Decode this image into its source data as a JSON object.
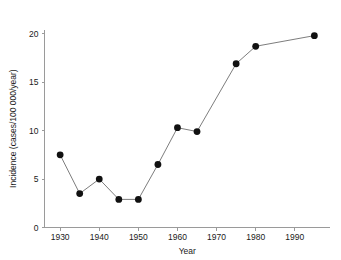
{
  "chart_data": {
    "type": "line",
    "title": "",
    "xlabel": "Year",
    "ylabel": "Incidence (cases/100 000/year)",
    "x": [
      1930,
      1935,
      1940,
      1945,
      1950,
      1955,
      1960,
      1965,
      1975,
      1980,
      1995
    ],
    "values": [
      7.5,
      3.5,
      5.0,
      2.9,
      2.9,
      6.5,
      10.3,
      9.9,
      16.9,
      18.7,
      19.8
    ],
    "series": [
      {
        "name": "Incidence",
        "points": [
          {
            "x": 1930,
            "y": 7.5
          },
          {
            "x": 1935,
            "y": 3.5
          },
          {
            "x": 1940,
            "y": 5.0
          },
          {
            "x": 1945,
            "y": 2.9
          },
          {
            "x": 1950,
            "y": 2.9
          },
          {
            "x": 1955,
            "y": 6.5
          },
          {
            "x": 1960,
            "y": 10.3
          },
          {
            "x": 1965,
            "y": 9.9
          },
          {
            "x": 1975,
            "y": 16.9
          },
          {
            "x": 1980,
            "y": 18.7
          },
          {
            "x": 1995,
            "y": 19.8
          }
        ],
        "line_color": "#6e6e6e",
        "marker_color": "#111111",
        "marker": "filled-circle"
      }
    ],
    "xlim": [
      1926,
      1999
    ],
    "ylim": [
      0,
      21
    ],
    "xticks": [
      1930,
      1940,
      1950,
      1960,
      1970,
      1980,
      1990
    ],
    "xtick_labels": [
      "1930",
      "1940",
      "1950",
      "1960",
      "1970",
      "1980",
      "1990"
    ],
    "yticks": [
      0,
      5,
      10,
      15,
      20
    ],
    "ytick_labels": [
      "0",
      "5",
      "10",
      "15",
      "20"
    ],
    "grid": false,
    "legend": false,
    "legend_position": "none",
    "axis_color": "#9a9a9a",
    "text_color": "#1a1a1a",
    "background": "#ffffff"
  }
}
